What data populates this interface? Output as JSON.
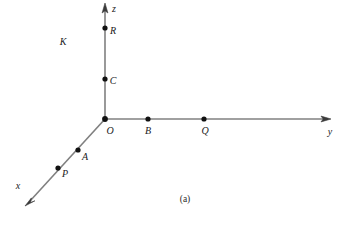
{
  "figure": {
    "caption": "(a)",
    "background_color": "#ffffff",
    "axis_color": "#808080",
    "point_color": "#111111",
    "label_color": "#1a1a1a",
    "origin": {
      "x": 105,
      "y": 119
    },
    "axes": [
      {
        "id": "z-axis",
        "label": "z",
        "label_x": 114,
        "label_y": 9,
        "x1": 105,
        "y1": 119,
        "x2": 105,
        "y2": 6,
        "arrow_angle_deg": -90
      },
      {
        "id": "y-axis",
        "label": "y",
        "label_x": 330,
        "label_y": 132,
        "x1": 105,
        "y1": 119,
        "x2": 328,
        "y2": 119,
        "arrow_angle_deg": 0
      },
      {
        "id": "x-axis",
        "label": "x",
        "label_x": 18,
        "label_y": 186,
        "x1": 105,
        "y1": 119,
        "x2": 27,
        "y2": 204,
        "arrow_angle_deg": 132.5
      }
    ],
    "points": [
      {
        "id": "point-R",
        "label": "R",
        "x": 105,
        "y": 28,
        "label_x": 113,
        "label_y": 31,
        "axis": "z"
      },
      {
        "id": "point-C",
        "label": "C",
        "x": 105,
        "y": 79,
        "label_x": 113,
        "label_y": 81,
        "axis": "z"
      },
      {
        "id": "point-O",
        "label": "O",
        "x": 105,
        "y": 119,
        "label_x": 110,
        "label_y": 131,
        "axis": "origin"
      },
      {
        "id": "point-B",
        "label": "B",
        "x": 148,
        "y": 119,
        "label_x": 148,
        "label_y": 131,
        "axis": "y"
      },
      {
        "id": "point-Q",
        "label": "Q",
        "x": 204,
        "y": 119,
        "label_x": 205,
        "label_y": 131,
        "axis": "y"
      },
      {
        "id": "point-A",
        "label": "A",
        "x": 78,
        "y": 150,
        "label_x": 85,
        "label_y": 157,
        "axis": "x"
      },
      {
        "id": "point-P",
        "label": "P",
        "x": 58,
        "y": 168,
        "label_x": 65,
        "label_y": 174,
        "axis": "x"
      }
    ],
    "region_labels": [
      {
        "id": "label-K",
        "label": "K",
        "x": 63,
        "y": 42
      }
    ]
  }
}
